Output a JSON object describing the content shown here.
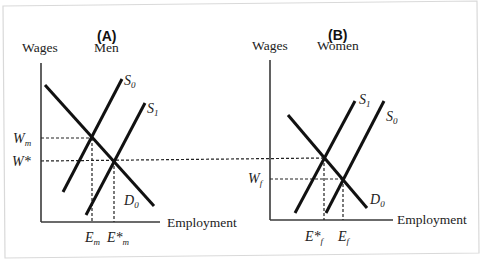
{
  "panels": {
    "a": {
      "title": "(A)",
      "y_label": "Wages",
      "group_label": "Men",
      "x_label": "Employment",
      "lines": {
        "y_axis": [
          41,
          63,
          41,
          222
        ],
        "x_axis": [
          41,
          222,
          160,
          222
        ],
        "d0": [
          45,
          85,
          154,
          206
        ],
        "s0": [
          63,
          192,
          122,
          79
        ],
        "s1": [
          86,
          215,
          145,
          103
        ],
        "wm_h": [
          41,
          138,
          92,
          138
        ],
        "em_v": [
          92,
          138,
          92,
          222
        ],
        "wstar_h": [
          41,
          161,
          324,
          158
        ],
        "estar_m_v": [
          114,
          161,
          114,
          222
        ]
      },
      "labels": {
        "s0": {
          "main": "S",
          "sub": "0"
        },
        "s1": {
          "main": "S",
          "sub": "1"
        },
        "d0": {
          "main": "D",
          "sub": "0"
        },
        "wm": {
          "main": "W",
          "sub": "m"
        },
        "wstar": {
          "main": "W*",
          "sub": ""
        },
        "em": {
          "main": "E",
          "sub": "m"
        },
        "estar_m": {
          "main": "E*",
          "sub": "m"
        }
      }
    },
    "b": {
      "title": "(B)",
      "y_label": "Wages",
      "group_label": "Women",
      "x_label": "Employment",
      "lines": {
        "y_axis": [
          270,
          60,
          270,
          220
        ],
        "x_axis": [
          270,
          220,
          393,
          220
        ],
        "d0": [
          288,
          115,
          367,
          208
        ],
        "s1": [
          295,
          213,
          355,
          101
        ],
        "s0": [
          326,
          213,
          384,
          101
        ],
        "wf_h": [
          270,
          179,
          343,
          179
        ],
        "ef_v": [
          343,
          179,
          343,
          220
        ],
        "estar_f_v": [
          324,
          158,
          324,
          220
        ]
      },
      "labels": {
        "s1": {
          "main": "S",
          "sub": "1"
        },
        "s0": {
          "main": "S",
          "sub": "0"
        },
        "d0": {
          "main": "D",
          "sub": "0"
        },
        "wf": {
          "main": "W",
          "sub": "f"
        },
        "estar_f": {
          "main": "E*",
          "sub": "f"
        },
        "ef": {
          "main": "E",
          "sub": "f"
        }
      }
    }
  },
  "frame": {
    "points": "3,6 477,1 479,253 5,258"
  }
}
